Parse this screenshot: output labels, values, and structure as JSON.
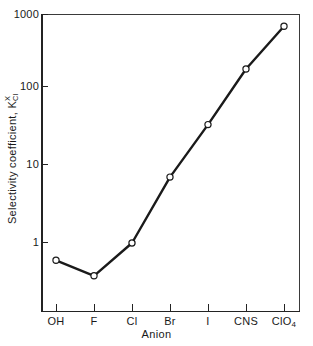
{
  "figure": {
    "background_color": "#ffffff",
    "line_color": "#1a1a1a",
    "marker_face_color": "#ffffff",
    "axis_color": "#232323"
  },
  "axes": {
    "y_title_prefix": "Selectivity  coefficient,  ",
    "y_title_symbol": "K",
    "y_title_sub": "Cl",
    "y_title_sup": "X",
    "x_title": "Anion",
    "y_tick_labels": [
      "1000",
      "100",
      "10",
      "1"
    ],
    "x_tick_labels": [
      "OH",
      "F",
      "Cl",
      "Br",
      "I",
      "CNS",
      "ClO"
    ],
    "x_tick_label_subs": [
      "",
      "",
      "",
      "",
      "",
      "",
      "4"
    ]
  },
  "chart_data": {
    "type": "line",
    "title": "",
    "xlabel": "Anion",
    "ylabel": "Selectivity coefficient, K_Cl^X",
    "categories": [
      "OH",
      "F",
      "Cl",
      "Br",
      "I",
      "CNS",
      "ClO4"
    ],
    "values": [
      0.6,
      0.38,
      1.0,
      7.0,
      33.0,
      170.0,
      600.0
    ],
    "yscale": "log",
    "ylim": [
      0.2,
      1000
    ],
    "y_ticks": [
      1,
      10,
      100,
      1000
    ],
    "grid": false,
    "legend": null,
    "marker": "open-circle",
    "series": [
      {
        "name": "Selectivity coefficient",
        "values": [
          0.6,
          0.38,
          1.0,
          7.0,
          33.0,
          170.0,
          600.0
        ]
      }
    ]
  }
}
